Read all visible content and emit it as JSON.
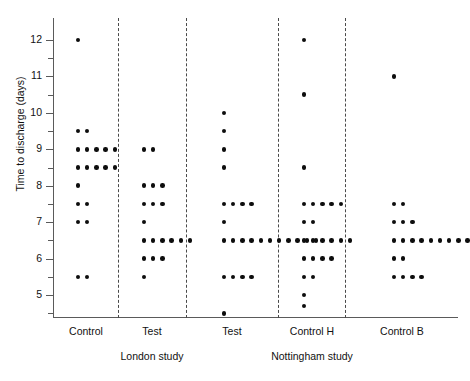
{
  "chart_data": {
    "type": "scatter",
    "title": "",
    "xlabel": "",
    "ylabel": "Time to discharge (days)",
    "ylim": [
      4.4,
      12.6
    ],
    "yticks": [
      5,
      6,
      7,
      8,
      9,
      10,
      11,
      12
    ],
    "ytick_labels": [
      "5",
      "6",
      "7",
      "8",
      "9",
      "10",
      "11",
      "12"
    ],
    "minor_yticks": [
      4.5,
      5.5,
      6.5,
      7.5,
      8.5,
      9.5,
      10.5,
      11.5
    ],
    "grid": false,
    "legend": "none",
    "plot_style": "dot-plot (stacked dots, 0.5-day bins)",
    "studies": [
      {
        "name": "London study",
        "groups": [
          "Control",
          "Test"
        ]
      },
      {
        "name": "Nottingham study",
        "groups": [
          "Test",
          "Control H",
          "Control B"
        ]
      }
    ],
    "groups": [
      {
        "label": "Control",
        "study": "London study",
        "stacks": [
          {
            "value": 12.0,
            "count": 1
          },
          {
            "value": 9.5,
            "count": 2
          },
          {
            "value": 9.0,
            "count": 5
          },
          {
            "value": 8.5,
            "count": 5
          },
          {
            "value": 8.0,
            "count": 1
          },
          {
            "value": 7.5,
            "count": 2
          },
          {
            "value": 7.0,
            "count": 2
          },
          {
            "value": 5.5,
            "count": 2
          }
        ]
      },
      {
        "label": "Test",
        "study": "London study",
        "stacks": [
          {
            "value": 9.0,
            "count": 2
          },
          {
            "value": 8.0,
            "count": 3
          },
          {
            "value": 7.5,
            "count": 3
          },
          {
            "value": 7.0,
            "count": 1
          },
          {
            "value": 6.5,
            "count": 6
          },
          {
            "value": 6.0,
            "count": 3
          },
          {
            "value": 5.5,
            "count": 1
          }
        ]
      },
      {
        "label": "Test",
        "study": "Nottingham study",
        "stacks": [
          {
            "value": 10.0,
            "count": 1
          },
          {
            "value": 9.5,
            "count": 1
          },
          {
            "value": 9.0,
            "count": 1
          },
          {
            "value": 8.5,
            "count": 1
          },
          {
            "value": 7.5,
            "count": 4
          },
          {
            "value": 7.0,
            "count": 1
          },
          {
            "value": 6.5,
            "count": 11
          },
          {
            "value": 5.5,
            "count": 4
          },
          {
            "value": 4.5,
            "count": 1
          }
        ]
      },
      {
        "label": "Control H",
        "study": "Nottingham study",
        "stacks": [
          {
            "value": 12.0,
            "count": 1
          },
          {
            "value": 10.5,
            "count": 1
          },
          {
            "value": 8.5,
            "count": 1
          },
          {
            "value": 7.5,
            "count": 5
          },
          {
            "value": 7.0,
            "count": 2
          },
          {
            "value": 6.5,
            "count": 6
          },
          {
            "value": 6.0,
            "count": 4
          },
          {
            "value": 5.5,
            "count": 2
          },
          {
            "value": 5.0,
            "count": 1
          },
          {
            "value": 4.7,
            "count": 1
          }
        ]
      },
      {
        "label": "Control B",
        "study": "Nottingham study",
        "stacks": [
          {
            "value": 11.0,
            "count": 1
          },
          {
            "value": 7.5,
            "count": 2
          },
          {
            "value": 7.0,
            "count": 3
          },
          {
            "value": 6.5,
            "count": 11
          },
          {
            "value": 6.0,
            "count": 2
          },
          {
            "value": 5.5,
            "count": 4
          }
        ]
      }
    ],
    "separators_after_group": [
      0,
      1,
      2,
      3
    ]
  },
  "layout": {
    "group_centers_px": [
      86,
      152,
      232,
      312,
      402
    ],
    "separator_x_px": [
      118,
      186,
      278,
      345
    ],
    "dot_spacing_px": 9.2,
    "dot_start_offset_px": -8
  }
}
